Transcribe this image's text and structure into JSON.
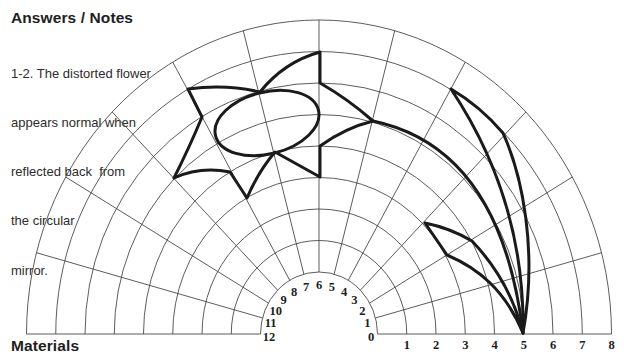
{
  "notes": {
    "heading": "Answers / Notes",
    "lines": [
      "1-2. The distorted flower",
      "appears normal when",
      "reflected back  from",
      "the circular",
      "mirror."
    ]
  },
  "materials": {
    "heading": "Materials"
  },
  "polar_grid": {
    "center": [
      319,
      334
    ],
    "inner_radius": [
      58.5,
      62
    ],
    "ring_step": [
      29.25,
      31.5
    ],
    "rings": 8,
    "sectors": 12,
    "line_color": "#4a4a4a",
    "angle_labels": [
      "0",
      "1",
      "2",
      "3",
      "4",
      "5",
      "6",
      "7",
      "8",
      "9",
      "10",
      "11",
      "12"
    ],
    "radius_labels": [
      "1",
      "2",
      "3",
      "4",
      "5",
      "6",
      "7",
      "8"
    ]
  },
  "drawing": {
    "stroke_color": "#1a1a1a",
    "flower_petals": "M320,52 L320,83 Q348,99 373,121 Q345,128 320,146 L320,177 L275,152 Q258,172 247,198 L230,172 Q200,166 174,178 Q190,146 202,117 L188,89 Q226,84 260,92 Q284,62 320,52 Z",
    "flower_center": {
      "cx": 267,
      "cy": 123,
      "rx": 53,
      "ry": 31,
      "rotation": -14
    },
    "stem": "M373,121 C440,135 505,185 523,333",
    "large_leaf": "M451,89 Q480,106 503,133 C522,175 538,250 523,333 M451,89 C485,140 525,220 523,333",
    "small_leaf": "M425,223 Q450,228 472,241 C492,262 512,290 523,333 M425,223 L447,255 C478,268 505,290 523,333"
  }
}
